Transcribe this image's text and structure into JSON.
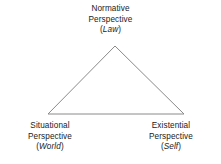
{
  "diagram": {
    "background_color": "#ffffff",
    "line_color": "#8a8a8a",
    "text_color": "#1a1a1a",
    "shape": {
      "type": "triangle",
      "apex": {
        "x": 115,
        "y": 46
      },
      "bottom_left": {
        "x": 48,
        "y": 114
      },
      "bottom_right": {
        "x": 184,
        "y": 114
      }
    },
    "vertices": {
      "top": {
        "line1": "Normative",
        "line2": "Perspective",
        "paren_open": "(",
        "term": "Law",
        "paren_close": ")"
      },
      "bottom_left": {
        "line1": "Situational",
        "line2": "Perspective",
        "paren_open": "(",
        "term": "World",
        "paren_close": ")"
      },
      "bottom_right": {
        "line1": "Existential",
        "line2": "Perspective",
        "paren_open": "(",
        "term": "Self",
        "paren_close": ")"
      }
    }
  }
}
